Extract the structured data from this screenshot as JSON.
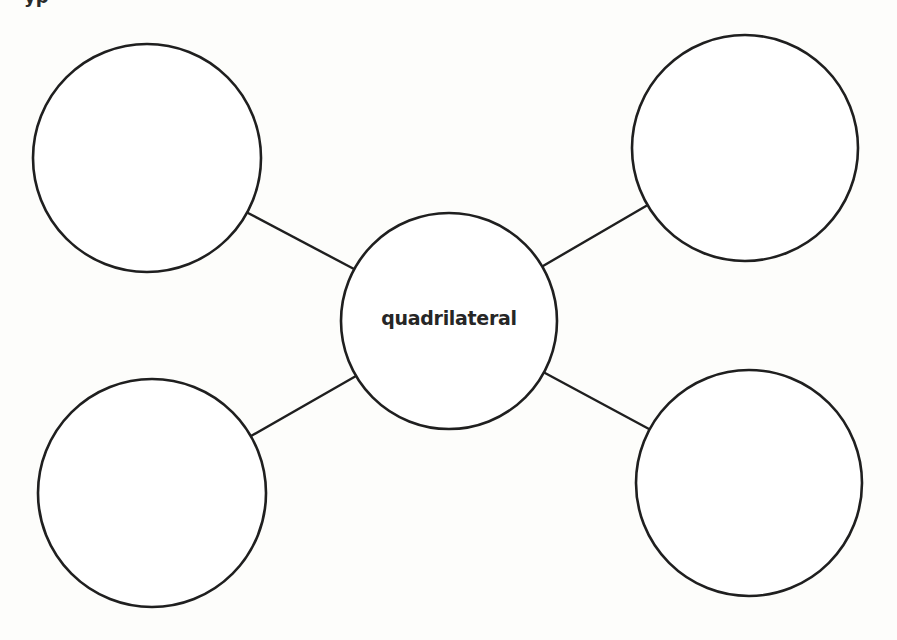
{
  "page": {
    "background": "#fdfdfb",
    "stroke_color": "#1f1f1f",
    "top_cut_text": "yp"
  },
  "diagram": {
    "type": "concept-map",
    "center": {
      "label": "quadrilateral",
      "cx": 449,
      "cy": 321,
      "r": 108
    },
    "outer_nodes": [
      {
        "id": "top-left",
        "label": "",
        "cx": 147,
        "cy": 158,
        "r": 114
      },
      {
        "id": "top-right",
        "label": "",
        "cx": 745,
        "cy": 148,
        "r": 113
      },
      {
        "id": "bottom-left",
        "label": "",
        "cx": 152,
        "cy": 493,
        "r": 114
      },
      {
        "id": "bottom-right",
        "label": "",
        "cx": 749,
        "cy": 483,
        "r": 113
      }
    ],
    "connectors": [
      {
        "from": "center",
        "to": "top-left",
        "x1": 354,
        "y1": 269,
        "x2": 248,
        "y2": 213
      },
      {
        "from": "center",
        "to": "top-right",
        "x1": 543,
        "y1": 266,
        "x2": 646,
        "y2": 206
      },
      {
        "from": "center",
        "to": "bottom-left",
        "x1": 356,
        "y1": 376,
        "x2": 251,
        "y2": 436
      },
      {
        "from": "center",
        "to": "bottom-right",
        "x1": 545,
        "y1": 373,
        "x2": 649,
        "y2": 429
      }
    ]
  }
}
